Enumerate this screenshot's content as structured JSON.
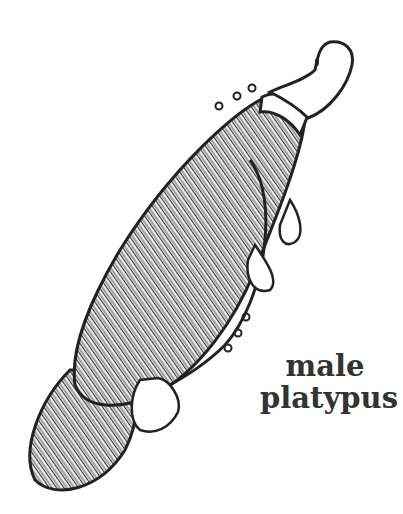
{
  "illustration": {
    "subject": "platypus line drawing",
    "stroke_color": "#222222",
    "fur_color": "#3a3a3a",
    "background": "#ffffff"
  },
  "caption": {
    "line1": "male",
    "line2": "platypus"
  }
}
